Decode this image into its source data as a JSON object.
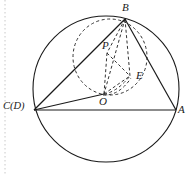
{
  "figure": {
    "kind": "geometry-diagram",
    "width": 191,
    "height": 174,
    "background_color": "#ffffff",
    "stroke_color": "#1a1a1a",
    "dashed_color": "#333333",
    "guide_color": "#c8c8c8"
  },
  "labels": {
    "B": "B",
    "P": "P",
    "E": "E",
    "O": "O",
    "CD": "C(D)",
    "A": "A"
  },
  "points": {
    "B": {
      "x": 125,
      "y": 19
    },
    "P": {
      "x": 107,
      "y": 53
    },
    "E": {
      "x": 130,
      "y": 76
    },
    "O": {
      "x": 104,
      "y": 94
    },
    "C": {
      "x": 34,
      "y": 110
    },
    "A": {
      "x": 176,
      "y": 110
    }
  },
  "label_positions": {
    "B": {
      "x": 122,
      "y": 3
    },
    "P": {
      "x": 103,
      "y": 40
    },
    "E": {
      "x": 136,
      "y": 71
    },
    "O": {
      "x": 100,
      "y": 96
    },
    "CD": {
      "x": 3,
      "y": 101
    },
    "A": {
      "x": 178,
      "y": 104
    }
  },
  "shapes": {
    "main_circle": {
      "cx": 106,
      "cy": 89,
      "r": 73,
      "style": "solid"
    },
    "dashed_circle": {
      "cx": 110,
      "cy": 57,
      "rx": 37,
      "ry": 38,
      "style": "dashed"
    },
    "dashed_arc_OE": {
      "from": "O",
      "to": "E",
      "style": "dashed"
    }
  },
  "segments": {
    "solid": [
      {
        "from": "C",
        "to": "B",
        "name": "segment-cb"
      },
      {
        "from": "C",
        "to": "A",
        "name": "segment-ca"
      },
      {
        "from": "C",
        "to": "O",
        "name": "segment-co"
      },
      {
        "from": "B",
        "to": "A",
        "name": "segment-ba"
      }
    ],
    "dashed": [
      {
        "from": "B",
        "to": "P",
        "name": "segment-bp"
      },
      {
        "from": "B",
        "to": "O",
        "name": "segment-bo"
      },
      {
        "from": "B",
        "to": "E",
        "name": "segment-be"
      },
      {
        "from": "P",
        "to": "O",
        "name": "segment-po"
      },
      {
        "from": "P",
        "to": "E",
        "name": "segment-pe"
      },
      {
        "from": "O",
        "to": "E",
        "name": "segment-oe"
      }
    ]
  }
}
